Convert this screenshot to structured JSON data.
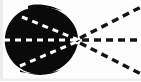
{
  "figure": {
    "alt_text": "Dark blob with dashed lines radiating from a vertex",
    "medium": "scanned bitmap line art",
    "colors": {
      "background": "#fdfdfd",
      "blob_fill": "#0a0a0a",
      "dash_dark": "#141414",
      "dash_light": "#ffffff",
      "edge_shadow": "#d8d8d8"
    },
    "canvas": {
      "width": 141,
      "height": 81
    },
    "vertex": {
      "label": "apex",
      "x": 78,
      "y": 40
    },
    "blob": {
      "name": "dark-ovoid-region",
      "center_x": 41,
      "center_y": 41,
      "radius_x": 36,
      "radius_y": 33
    },
    "rays_outer": [
      {
        "name": "upper-right-ray",
        "x1": 80,
        "y1": 38,
        "x2": 141,
        "y2": 7
      },
      {
        "name": "middle-right-ray",
        "x1": 82,
        "y1": 40,
        "x2": 141,
        "y2": 40
      },
      {
        "name": "lower-right-ray",
        "x1": 80,
        "y1": 43,
        "x2": 141,
        "y2": 74
      }
    ],
    "rays_inner": [
      {
        "name": "upper-left-inner-ray",
        "x1": 22,
        "y1": 17,
        "x2": 76,
        "y2": 39
      },
      {
        "name": "middle-left-inner-ray",
        "x1": 4,
        "y1": 40,
        "x2": 76,
        "y2": 40
      },
      {
        "name": "lower-left-inner-ray",
        "x1": 20,
        "y1": 66,
        "x2": 76,
        "y2": 42
      }
    ],
    "dash_patterns": {
      "outer": "7 5",
      "inner": "6 5",
      "stroke_width_outer": 3.4,
      "stroke_width_inner": 3.0
    }
  }
}
